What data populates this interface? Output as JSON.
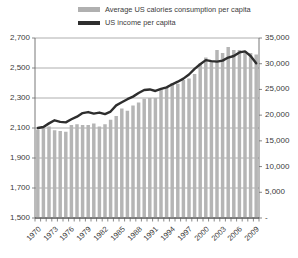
{
  "legend": {
    "position": "top",
    "items": [
      {
        "label": "Average US calories consumption per capita",
        "marker": "bar-swatch-icon",
        "color": "#b0b0b0"
      },
      {
        "label": "US income per capita",
        "marker": "line-swatch-icon",
        "color": "#2e2e2e"
      }
    ]
  },
  "chart_data": {
    "type": "bar",
    "title": "",
    "subtitle": "",
    "xlabel": "",
    "ylabel": "",
    "grid": true,
    "x": [
      1970,
      1971,
      1972,
      1973,
      1974,
      1975,
      1976,
      1977,
      1978,
      1979,
      1980,
      1981,
      1982,
      1983,
      1984,
      1985,
      1986,
      1987,
      1988,
      1989,
      1990,
      1991,
      1992,
      1993,
      1994,
      1995,
      1996,
      1997,
      1998,
      1999,
      2000,
      2001,
      2002,
      2003,
      2004,
      2005,
      2006,
      2007,
      2008,
      2009
    ],
    "xtick_labels": [
      "1970",
      "1973",
      "1976",
      "1979",
      "1982",
      "1985",
      "1988",
      "1991",
      "1994",
      "1997",
      "2000",
      "2003",
      "2006",
      "2009"
    ],
    "xtick_every": 3,
    "axes": {
      "left": {
        "name": "calories-axis",
        "ylim": [
          1500,
          2700
        ],
        "tick_labels": [
          "2,700",
          "2,500",
          "2,300",
          "2,100",
          "1,900",
          "1,700",
          "1,500"
        ],
        "tick_values": [
          2700,
          2500,
          2300,
          2100,
          1900,
          1700,
          1500
        ]
      },
      "right": {
        "name": "income-axis",
        "ylim": [
          0,
          35000
        ],
        "tick_labels": [
          "35,000",
          "30,000",
          "25,000",
          "20,000",
          "15,000",
          "10,000",
          "5,000",
          "-"
        ],
        "tick_values": [
          35000,
          30000,
          25000,
          20000,
          15000,
          10000,
          5000,
          0
        ]
      }
    },
    "series": [
      {
        "name": "Average US calories consumption per capita",
        "type": "bar",
        "axis": "left",
        "color": "#b5b5b5",
        "values": [
          2090,
          2100,
          2110,
          2085,
          2080,
          2075,
          2120,
          2125,
          2120,
          2120,
          2130,
          2110,
          2125,
          2155,
          2180,
          2230,
          2215,
          2250,
          2270,
          2295,
          2300,
          2300,
          2360,
          2370,
          2400,
          2395,
          2420,
          2430,
          2460,
          2530,
          2570,
          2545,
          2620,
          2600,
          2640,
          2620,
          2620,
          2610,
          2600,
          2590
        ]
      },
      {
        "name": "US income per capita",
        "type": "line",
        "axis": "right",
        "color": "#2e2e2e",
        "values": [
          17500,
          17700,
          18400,
          19000,
          18700,
          18600,
          19200,
          19700,
          20400,
          20600,
          20300,
          20500,
          20200,
          20700,
          21900,
          22500,
          23100,
          23600,
          24300,
          24900,
          25000,
          24700,
          25100,
          25400,
          26000,
          26500,
          27100,
          27900,
          29000,
          29900,
          30700,
          30500,
          30400,
          30600,
          31200,
          31500,
          32200,
          32400,
          31500,
          30100
        ]
      }
    ]
  }
}
